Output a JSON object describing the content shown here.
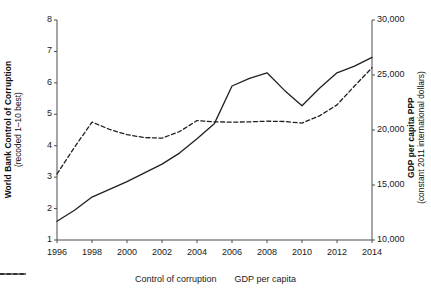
{
  "chart_data": {
    "type": "line",
    "title": "",
    "xlabel": "",
    "x": [
      1996,
      1997,
      1998,
      1999,
      2000,
      2001,
      2002,
      2003,
      2004,
      2005,
      2006,
      2007,
      2008,
      2009,
      2010,
      2011,
      2012,
      2013,
      2014
    ],
    "xlim": [
      1996,
      2014
    ],
    "xticks": [
      "1996",
      "1998",
      "2000",
      "2002",
      "2004",
      "2006",
      "2008",
      "2010",
      "2012",
      "2014"
    ],
    "xtick_values": [
      1996,
      1998,
      2000,
      2002,
      2004,
      2006,
      2008,
      2010,
      2012,
      2014
    ],
    "grid": false,
    "legend_position": "bottom",
    "axes": [
      {
        "id": "left",
        "side": "left",
        "title_bold": "World Bank Control of Corruption",
        "title_sub": "(recoded 1–10 best)",
        "ylim": [
          1,
          8
        ],
        "yticks": [
          "1",
          "2",
          "3",
          "4",
          "5",
          "6",
          "7",
          "8"
        ],
        "ytick_values": [
          1,
          2,
          3,
          4,
          5,
          6,
          7,
          8
        ]
      },
      {
        "id": "right",
        "side": "right",
        "title_bold": "GDP per capita PPP",
        "title_sub": "(constant 2011 international dollars)",
        "ylim": [
          10000,
          30000
        ],
        "yticks": [
          "10,000",
          "15,000",
          "20,000",
          "25,000",
          "30,000"
        ],
        "ytick_values": [
          10000,
          15000,
          20000,
          25000,
          30000
        ]
      }
    ],
    "series": [
      {
        "name": "Control of corruption",
        "axis": "left",
        "style": "dashed",
        "color": "#231f20",
        "values": [
          3.1,
          3.95,
          4.75,
          4.52,
          4.35,
          4.26,
          4.24,
          4.45,
          4.8,
          4.76,
          4.75,
          4.76,
          4.78,
          4.77,
          4.72,
          4.95,
          5.3,
          5.9,
          6.48
        ]
      },
      {
        "name": "GDP per capita",
        "axis": "right",
        "style": "solid",
        "color": "#231f20",
        "values": [
          11700,
          12700,
          13900,
          14600,
          15300,
          16100,
          16900,
          17900,
          19200,
          20600,
          24000,
          24700,
          25200,
          23600,
          22200,
          23800,
          25200,
          25800,
          26600
        ]
      }
    ],
    "legend": [
      {
        "label": "Control of corruption",
        "style": "dashed"
      },
      {
        "label": "GDP per capita",
        "style": "solid"
      }
    ]
  },
  "colors": {
    "ink": "#231f20",
    "axis": "#4d4d4d",
    "background": "#ffffff"
  }
}
